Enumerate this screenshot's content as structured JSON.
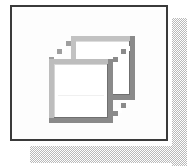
{
  "panel": {
    "name": "icon-panel",
    "background_color": "#fdfdfd",
    "border_color": "#3a3a3a",
    "border_width_px": 2,
    "width_px": 158,
    "height_px": 136
  },
  "shadow": {
    "style": "dithered-checkerboard",
    "color": "#b9b9b9",
    "offset_px": 5,
    "right_label": "panel drop shadow right",
    "bottom_label": "panel drop shadow bottom"
  },
  "icon": {
    "name": "wireframe-cube-icon",
    "label": "3D Cube",
    "description": "Two offset square outlines connected by stepped diagonal lines forming an isometric wireframe cube",
    "front_face": {
      "fill_color": "#ffffff",
      "stroke_color": "#9a9a9a",
      "shadow_stroke_color": "#777777",
      "x": 3,
      "y": 26,
      "width": 64,
      "height": 64
    },
    "back_face": {
      "stroke_color": "#a8a8a8",
      "shadow_stroke_color": "#7d7d7d",
      "x": 25,
      "y": 3,
      "width": 64,
      "height": 64
    },
    "connector": {
      "style": "stepped-pixel-diagonal",
      "step_px": 4,
      "steps": 5,
      "color": "#9a9a9a"
    },
    "palette": {
      "light_gray": "#c8c8c8",
      "mid_gray": "#9a9a9a",
      "dark_gray": "#6e6e6e",
      "white": "#ffffff"
    }
  },
  "canvas": {
    "width_px": 195,
    "height_px": 167,
    "background_color": "#ffffff"
  }
}
